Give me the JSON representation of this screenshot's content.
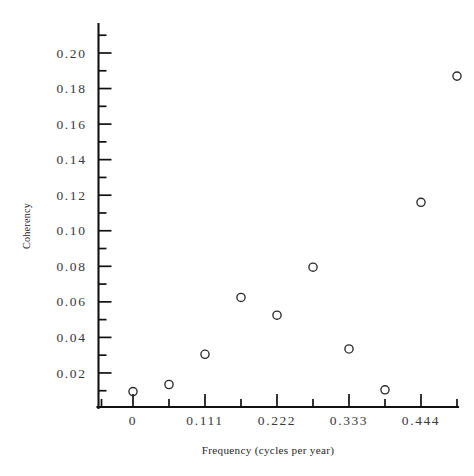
{
  "chart_data": {
    "type": "scatter",
    "title": "",
    "xlabel": "Frequency (cycles per year)",
    "ylabel": "Coherency",
    "xlim": [
      -0.0486,
      0.5139
    ],
    "ylim": [
      0.0,
      0.2113
    ],
    "grid": false,
    "legend": null,
    "marker": "open-circle",
    "x_ticks_major": [
      {
        "value": 0.0,
        "label": "0"
      },
      {
        "value": 0.111,
        "label": "0.111"
      },
      {
        "value": 0.222,
        "label": "0.222"
      },
      {
        "value": 0.333,
        "label": "0.333"
      },
      {
        "value": 0.444,
        "label": "0.444"
      }
    ],
    "x_ticks_minor": [
      -0.0486,
      0.0555,
      0.1665,
      0.2775,
      0.3885,
      0.4995
    ],
    "y_ticks_major": [
      {
        "value": 0.02,
        "label": "0.02"
      },
      {
        "value": 0.04,
        "label": "0.04"
      },
      {
        "value": 0.06,
        "label": "0.06"
      },
      {
        "value": 0.08,
        "label": "0.08"
      },
      {
        "value": 0.1,
        "label": "0.10"
      },
      {
        "value": 0.12,
        "label": "0.12"
      },
      {
        "value": 0.14,
        "label": "0.14"
      },
      {
        "value": 0.16,
        "label": "0.16"
      },
      {
        "value": 0.18,
        "label": "0.18"
      },
      {
        "value": 0.2,
        "label": "0.20"
      }
    ],
    "y_ticks_minor": [
      0.01,
      0.03,
      0.05,
      0.07,
      0.09,
      0.11,
      0.13,
      0.15,
      0.17,
      0.19,
      0.21
    ],
    "points": [
      {
        "x": 0.0,
        "y": 0.0095
      },
      {
        "x": 0.0555,
        "y": 0.0135
      },
      {
        "x": 0.111,
        "y": 0.0305
      },
      {
        "x": 0.1665,
        "y": 0.0625
      },
      {
        "x": 0.222,
        "y": 0.0525
      },
      {
        "x": 0.2775,
        "y": 0.0795
      },
      {
        "x": 0.333,
        "y": 0.0335
      },
      {
        "x": 0.3885,
        "y": 0.0105
      },
      {
        "x": 0.444,
        "y": 0.116
      },
      {
        "x": 0.4995,
        "y": 0.187
      }
    ],
    "colors": {
      "axis": "#111111",
      "marker_stroke": "#2a2a2a",
      "tick_label": "#39393b",
      "axis_label": "#262628",
      "background": "#ffffff"
    }
  }
}
